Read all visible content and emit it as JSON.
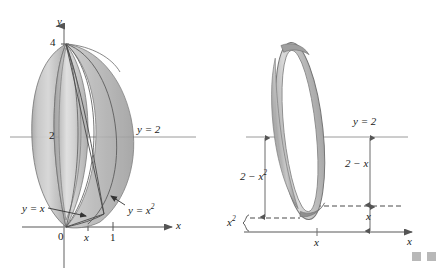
{
  "figure": {
    "type": "math-diagram",
    "background": "#ffffff",
    "ink_color": "#222222",
    "axis_color": "#8a8a8a",
    "surface_fill_light": "#d8d8d8",
    "surface_fill_mid": "#bcbcbc",
    "surface_fill_dark": "#9a9a9a",
    "outline_color": "#555555"
  },
  "left_panel": {
    "name": "solid-of-revolution-panel",
    "axes": {
      "y_axis_label": "y",
      "x_axis_label": "x",
      "origin_label": "0"
    },
    "y_ticks": [
      {
        "label": "4",
        "value": 4
      },
      {
        "label": "2",
        "value": 2
      }
    ],
    "x_ticks": [
      {
        "label": "x",
        "value": 0.62
      },
      {
        "label": "1",
        "value": 1
      }
    ],
    "annotations": [
      {
        "name": "axis-of-revolution-label",
        "text": "y = 2"
      },
      {
        "name": "curve-label-line",
        "text": "y = x"
      },
      {
        "name": "curve-label-parabola",
        "text": "y = x",
        "exponent": "2"
      }
    ]
  },
  "right_panel": {
    "name": "washer-cross-section-panel",
    "axes": {
      "x_axis_label": "x",
      "tick_label": "x"
    },
    "annotations": [
      {
        "name": "axis-of-revolution-label",
        "text": "y = 2"
      },
      {
        "name": "outer-radius-label",
        "text": "2 − x",
        "exponent": "2"
      },
      {
        "name": "inner-radius-label",
        "text": "2 − x"
      },
      {
        "name": "inner-height-label",
        "text": "x"
      },
      {
        "name": "lower-offset-label",
        "text": "x",
        "exponent": "2"
      }
    ]
  },
  "corner_marks": {
    "name": "page-corner-squares",
    "count": 2,
    "color": "#b8b8b8"
  }
}
